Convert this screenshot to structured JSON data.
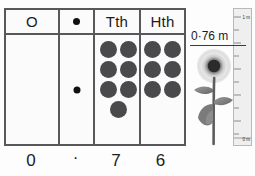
{
  "chart": {
    "name": "place-value-chart",
    "columns": [
      {
        "key": "ones",
        "header": "O",
        "digit": "0",
        "counters": 0,
        "is_decimal_point": false
      },
      {
        "key": "decimal",
        "header": "•",
        "digit": "·",
        "counters": 0,
        "is_decimal_point": true
      },
      {
        "key": "tenths",
        "header": "Tth",
        "digit": "7",
        "counters": 7,
        "is_decimal_point": false
      },
      {
        "key": "hundredths",
        "header": "Hth",
        "digit": "6",
        "counters": 6,
        "is_decimal_point": false
      }
    ]
  },
  "measurement": {
    "label": "0·76 m",
    "value": 0.76,
    "unit": "m"
  },
  "ruler": {
    "top_label": "1 m",
    "bottom_label": "0 m",
    "min": 0,
    "max": 1,
    "major_ticks": 10
  },
  "illustration": {
    "subject": "sunflower"
  },
  "colors": {
    "border": "#58585a",
    "counter": "#4a4a4c",
    "text": "#1c1c1c",
    "ruler_face": "#efefef"
  },
  "chart_data": {
    "type": "table",
    "categories": [
      "O",
      "•",
      "Tth",
      "Hth"
    ],
    "values": [
      0,
      null,
      7,
      6
    ],
    "counter_counts": [
      0,
      0,
      7,
      6
    ],
    "digits": [
      "0",
      "·",
      "7",
      "6"
    ],
    "number": "0·76",
    "xlabel": "Place value column",
    "ylabel": "Number of counters",
    "annotations": [
      "0·76 m",
      "1 m",
      "0 m"
    ]
  }
}
